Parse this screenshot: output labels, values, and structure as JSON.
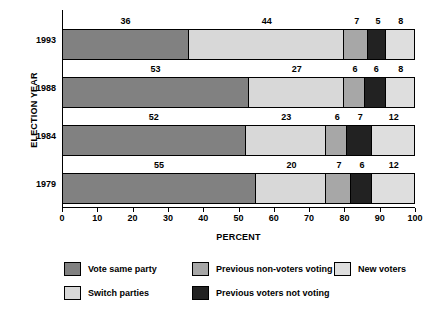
{
  "chart_data": {
    "type": "bar",
    "orientation": "horizontal",
    "stacked": true,
    "title": "",
    "xlabel": "PERCENT",
    "ylabel": "ELECTION YEAR",
    "categories": [
      "1993",
      "1988",
      "1984",
      "1979"
    ],
    "xlim": [
      0,
      100
    ],
    "xticks": [
      0,
      10,
      20,
      30,
      40,
      50,
      60,
      70,
      80,
      90,
      100
    ],
    "xtick_labels": [
      "0",
      "10",
      "20",
      "30",
      "40",
      "50",
      "60",
      "70",
      "80",
      "90",
      "100"
    ],
    "grid": false,
    "legend_position": "bottom",
    "series": [
      {
        "name": "Vote same party",
        "color": "#818181",
        "values": [
          36,
          53,
          52,
          55
        ]
      },
      {
        "name": "Switch parties",
        "color": "#d8d8d8",
        "values": [
          44,
          27,
          23,
          20
        ]
      },
      {
        "name": "Previous non-voters voting",
        "color": "#a7a7a7",
        "values": [
          7,
          6,
          6,
          7
        ]
      },
      {
        "name": "Previous voters not voting",
        "color": "#222222",
        "values": [
          5,
          6,
          7,
          6
        ]
      },
      {
        "name": "New voters",
        "color": "#dedede",
        "values": [
          8,
          8,
          12,
          12
        ]
      }
    ],
    "rows": [
      {
        "year": "1993",
        "segments": [
          {
            "label": "36",
            "value": 36,
            "color": "#818181",
            "series": "Vote same party"
          },
          {
            "label": "44",
            "value": 44,
            "color": "#d8d8d8",
            "series": "Switch parties"
          },
          {
            "label": "7",
            "value": 7,
            "color": "#a7a7a7",
            "series": "Previous non-voters voting"
          },
          {
            "label": "5",
            "value": 5,
            "color": "#222222",
            "series": "Previous voters not voting"
          },
          {
            "label": "8",
            "value": 8,
            "color": "#dedede",
            "series": "New voters"
          }
        ]
      },
      {
        "year": "1988",
        "segments": [
          {
            "label": "53",
            "value": 53,
            "color": "#818181",
            "series": "Vote same party"
          },
          {
            "label": "27",
            "value": 27,
            "color": "#d8d8d8",
            "series": "Switch parties"
          },
          {
            "label": "6",
            "value": 6,
            "color": "#a7a7a7",
            "series": "Previous non-voters voting"
          },
          {
            "label": "6",
            "value": 6,
            "color": "#222222",
            "series": "Previous voters not voting"
          },
          {
            "label": "8",
            "value": 8,
            "color": "#dedede",
            "series": "New voters"
          }
        ]
      },
      {
        "year": "1984",
        "segments": [
          {
            "label": "52",
            "value": 52,
            "color": "#818181",
            "series": "Vote same party"
          },
          {
            "label": "23",
            "value": 23,
            "color": "#d8d8d8",
            "series": "Switch parties"
          },
          {
            "label": "6",
            "value": 6,
            "color": "#a7a7a7",
            "series": "Previous non-voters voting"
          },
          {
            "label": "7",
            "value": 7,
            "color": "#222222",
            "series": "Previous voters not voting"
          },
          {
            "label": "12",
            "value": 12,
            "color": "#dedede",
            "series": "New voters"
          }
        ]
      },
      {
        "year": "1979",
        "segments": [
          {
            "label": "55",
            "value": 55,
            "color": "#818181",
            "series": "Vote same party"
          },
          {
            "label": "20",
            "value": 20,
            "color": "#d8d8d8",
            "series": "Switch parties"
          },
          {
            "label": "7",
            "value": 7,
            "color": "#a7a7a7",
            "series": "Previous non-voters voting"
          },
          {
            "label": "6",
            "value": 6,
            "color": "#222222",
            "series": "Previous voters not voting"
          },
          {
            "label": "12",
            "value": 12,
            "color": "#dedede",
            "series": "New voters"
          }
        ]
      }
    ],
    "legend": [
      {
        "label": "Vote same party",
        "color": "#818181",
        "col": 0,
        "row": 0
      },
      {
        "label": "Previous non-voters voting",
        "color": "#a7a7a7",
        "col": 1,
        "row": 0
      },
      {
        "label": "New voters",
        "color": "#dedede",
        "col": 2,
        "row": 0
      },
      {
        "label": "Switch parties",
        "color": "#d8d8d8",
        "col": 0,
        "row": 1
      },
      {
        "label": "Previous voters not voting",
        "color": "#222222",
        "col": 1,
        "row": 1
      }
    ]
  }
}
